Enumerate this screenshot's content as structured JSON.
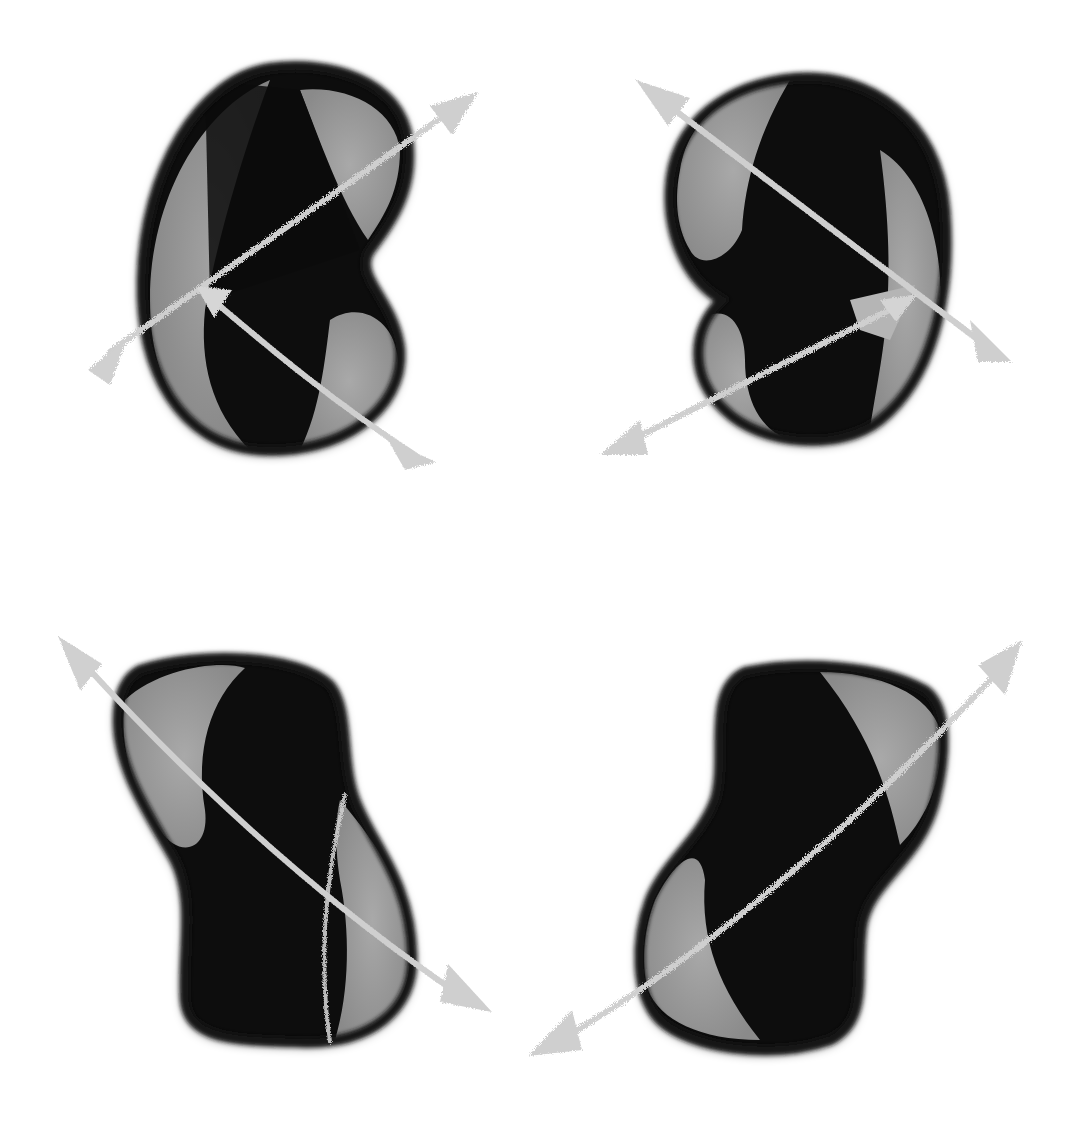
{
  "image": {
    "description": "Four dark bean-shaped objects with light gray double-headed rotation arrows",
    "background": "#ffffff",
    "colors": {
      "body": "#0e0e0e",
      "rim": "#2a2a2a",
      "band": "#939393",
      "band_light": "#a8a8a8",
      "arrow": "#cdcdcd",
      "ground_line": "#e4e4e4"
    },
    "figures": [
      {
        "id": "top-left",
        "shape": "kidney-bean",
        "notch_side": "right"
      },
      {
        "id": "top-right",
        "shape": "kidney-bean",
        "notch_side": "left"
      },
      {
        "id": "bottom-left",
        "shape": "peanut",
        "tilt": "left"
      },
      {
        "id": "bottom-right",
        "shape": "peanut",
        "tilt": "right"
      }
    ]
  }
}
